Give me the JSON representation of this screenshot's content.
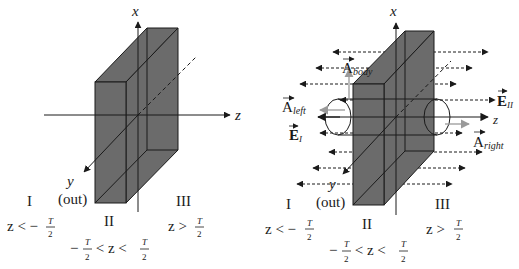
{
  "colors": {
    "slab_fill": "#6b6b6b",
    "slab_edge": "#1a1a1a",
    "area_vector": "#9a9a9a",
    "field_line": "#1a1a1a"
  },
  "left_panel": {
    "axis_x": "x",
    "axis_z": "z",
    "axis_y": "y",
    "axis_y_note": "(out)",
    "region_I": {
      "name": "I",
      "cond_lhs": "z < −",
      "num": "T",
      "den": "2"
    },
    "region_II": {
      "name": "II",
      "cond_lhs": "−",
      "num": "T",
      "den": "2",
      "mid": " < z < ",
      "num2": "T",
      "den2": "2"
    },
    "region_III": {
      "name": "III",
      "cond_lhs": "z >",
      "num": "T",
      "den": "2"
    }
  },
  "right_panel": {
    "axis_x": "x",
    "axis_z": "z",
    "axis_y": "y",
    "axis_y_note": "(out)",
    "vec_A_body": {
      "base": "A",
      "sub": "body"
    },
    "vec_A_left": {
      "base": "A",
      "sub": "left"
    },
    "vec_A_right": {
      "base": "A",
      "sub": "right"
    },
    "vec_E_I": {
      "base": "E",
      "sub": "I"
    },
    "vec_E_II": {
      "base": "E",
      "sub": "II"
    },
    "region_I": {
      "name": "I",
      "cond_lhs": "z < −",
      "num": "T",
      "den": "2"
    },
    "region_II": {
      "name": "II",
      "cond_lhs": "−",
      "num": "T",
      "den": "2",
      "mid": " < z < ",
      "num2": "T",
      "den2": "2"
    },
    "region_III": {
      "name": "III",
      "cond_lhs": "z >",
      "num": "T",
      "den": "2"
    }
  }
}
